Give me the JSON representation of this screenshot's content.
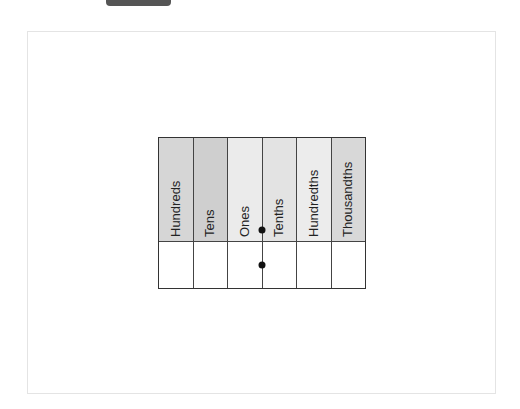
{
  "diagram": {
    "columns": [
      {
        "label": "Hundreds",
        "fill": "#d6d6d6"
      },
      {
        "label": "Tens",
        "fill": "#cfcfcf"
      },
      {
        "label": "Ones",
        "fill": "#ebebeb"
      },
      {
        "label": "Tenths",
        "fill": "#e3e3e3"
      },
      {
        "label": "Hundredths",
        "fill": "#ececec"
      },
      {
        "label": "Thousandths",
        "fill": "#d8d8d8"
      }
    ],
    "value_row": [
      "",
      "",
      "",
      "",
      "",
      ""
    ],
    "decimal_points": [
      {
        "between": [
          "Ones",
          "Tenths"
        ],
        "row": "header"
      },
      {
        "between": [
          "Ones",
          "Tenths"
        ],
        "row": "value"
      }
    ]
  }
}
